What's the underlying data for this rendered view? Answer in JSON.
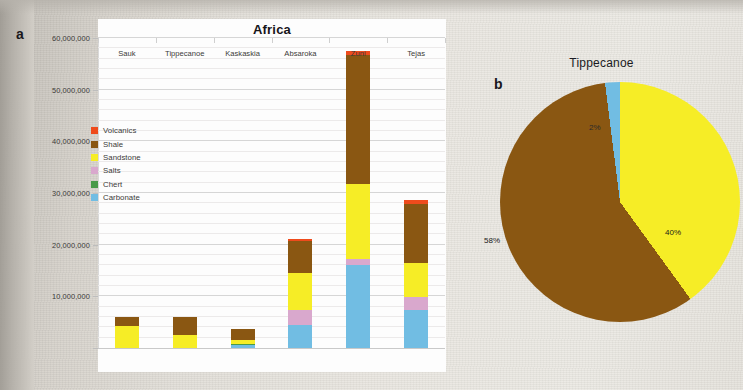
{
  "figure": {
    "panel_a_letter": "a",
    "panel_b_letter": "b"
  },
  "chart_data": [
    {
      "type": "bar",
      "subtype": "stacked-bar",
      "panel": "a",
      "title": "Africa",
      "xlabel": "",
      "ylabel": "",
      "ylim": [
        0,
        60000000
      ],
      "grid": true,
      "grid_major_step": 10000000,
      "grid_minor_step": 2000000,
      "legend_position": "inside-upper-left",
      "ytick_labels": [
        "60,000,000",
        "50,000,000",
        "40,000,000",
        "30,000,000",
        "20,000,000",
        "10,000,000"
      ],
      "ytick_values": [
        60000000,
        50000000,
        40000000,
        30000000,
        20000000,
        10000000
      ],
      "categories": [
        "Sauk",
        "Tippecanoe",
        "Kaskaskia",
        "Absaroka",
        "Zuni",
        "Tejas"
      ],
      "series": [
        {
          "name": "Carbonate",
          "color": "#71bde3",
          "values": [
            0,
            0,
            500000,
            4500000,
            16000000,
            7300000
          ]
        },
        {
          "name": "Chert",
          "color": "#4a9a4a",
          "values": [
            0,
            0,
            300000,
            0,
            0,
            0
          ]
        },
        {
          "name": "Salts",
          "color": "#d9a8cd",
          "values": [
            0,
            0,
            0,
            2800000,
            1200000,
            2500000
          ]
        },
        {
          "name": "Sandstone",
          "color": "#f6ed26",
          "values": [
            4200000,
            2500000,
            700000,
            7200000,
            14500000,
            6700000
          ]
        },
        {
          "name": "Shale",
          "color": "#8a5712",
          "values": [
            1900000,
            3600000,
            2200000,
            6200000,
            25000000,
            11300000
          ]
        },
        {
          "name": "Volcanics",
          "color": "#ef4b1c",
          "values": [
            0,
            0,
            0,
            400000,
            800000,
            800000
          ]
        }
      ],
      "legend": [
        {
          "label": "Volcanics",
          "color": "#ef4b1c"
        },
        {
          "label": "Shale",
          "color": "#8a5712"
        },
        {
          "label": "Sandstone",
          "color": "#f6ed26"
        },
        {
          "label": "Salts",
          "color": "#d9a8cd"
        },
        {
          "label": "Chert",
          "color": "#4a9a4a"
        },
        {
          "label": "Carbonate",
          "color": "#71bde3"
        }
      ]
    },
    {
      "type": "pie",
      "panel": "b",
      "title": "Tippecanoe",
      "labels": [
        "Sandstone",
        "Shale",
        "Carbonate"
      ],
      "values": [
        40,
        58,
        2
      ],
      "value_labels": [
        "40%",
        "58%",
        "2%"
      ],
      "colors": [
        "#f6ed26",
        "#8a5712",
        "#71bde3"
      ],
      "start_angle_deg": 0,
      "legend_position": "none"
    }
  ]
}
